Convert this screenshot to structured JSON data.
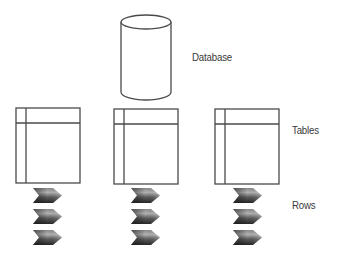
{
  "diagram": {
    "type": "database-hierarchy",
    "labels": {
      "database": "Database",
      "tables": "Tables",
      "rows": "Rows"
    },
    "database": {
      "shape": "cylinder-icon",
      "count": 1
    },
    "tables": [
      {
        "id": "table-1",
        "rows": 3
      },
      {
        "id": "table-2",
        "rows": 3
      },
      {
        "id": "table-3",
        "rows": 3
      }
    ],
    "colors": {
      "stroke": "#4a4a4a",
      "text": "#3a3a3a",
      "row_dark": "#2e2e2e",
      "row_light": "#a8a8a8",
      "background": "#ffffff"
    }
  }
}
